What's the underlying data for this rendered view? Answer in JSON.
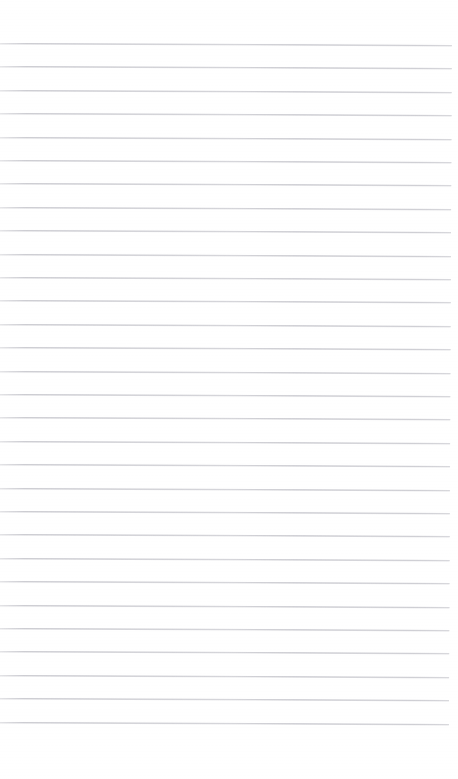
{
  "document": {
    "kind": "blank-ruled-paper-scan",
    "description": "Scanned blank page of lined notebook paper",
    "page_text": "",
    "width_px": 458,
    "height_px": 779
  },
  "paper": {
    "background_color": "#ffffff",
    "rule_color": "#c9c9cf",
    "rule_thickness_px": 1,
    "rule_spacing_px": 23.4,
    "first_rule_y_px": 43,
    "last_rule_y_px": 722,
    "rule_count": 30,
    "left_margin_px": 0,
    "right_margin_px": 6,
    "top_margin_px": 43,
    "bottom_margin_px": 57,
    "scan_skew_deg": 0.25,
    "has_margin_rule": false,
    "has_holes": false,
    "has_header": false,
    "has_handwriting": false
  },
  "rules": [
    {
      "index": 1,
      "y": 43
    },
    {
      "index": 2,
      "y": 66
    },
    {
      "index": 3,
      "y": 90
    },
    {
      "index": 4,
      "y": 113
    },
    {
      "index": 5,
      "y": 137
    },
    {
      "index": 6,
      "y": 160
    },
    {
      "index": 7,
      "y": 183
    },
    {
      "index": 8,
      "y": 207
    },
    {
      "index": 9,
      "y": 230
    },
    {
      "index": 10,
      "y": 254
    },
    {
      "index": 11,
      "y": 277
    },
    {
      "index": 12,
      "y": 300
    },
    {
      "index": 13,
      "y": 324
    },
    {
      "index": 14,
      "y": 347
    },
    {
      "index": 15,
      "y": 371
    },
    {
      "index": 16,
      "y": 394
    },
    {
      "index": 17,
      "y": 417
    },
    {
      "index": 18,
      "y": 441
    },
    {
      "index": 19,
      "y": 464
    },
    {
      "index": 20,
      "y": 488
    },
    {
      "index": 21,
      "y": 511
    },
    {
      "index": 22,
      "y": 534
    },
    {
      "index": 23,
      "y": 558
    },
    {
      "index": 24,
      "y": 581
    },
    {
      "index": 25,
      "y": 605
    },
    {
      "index": 26,
      "y": 628
    },
    {
      "index": 27,
      "y": 651
    },
    {
      "index": 28,
      "y": 675
    },
    {
      "index": 29,
      "y": 698
    },
    {
      "index": 30,
      "y": 722
    }
  ]
}
